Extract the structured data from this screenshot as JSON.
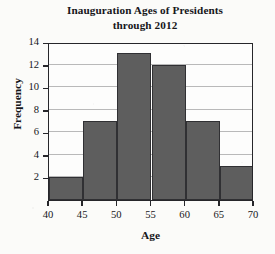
{
  "chart_data": {
    "type": "bar",
    "title": "Inauguration Ages of Presidents through 2012",
    "title_lines": [
      "Inauguration Ages of Presidents",
      "through 2012"
    ],
    "xlabel": "Age",
    "ylabel": "Frequency",
    "categories": [
      "40-45",
      "45-50",
      "50-55",
      "55-60",
      "60-65",
      "65-70"
    ],
    "bin_edges": [
      40,
      45,
      50,
      55,
      60,
      65,
      70
    ],
    "values": [
      2,
      7,
      13,
      12,
      7,
      3
    ],
    "xlim": [
      40,
      70
    ],
    "ylim": [
      0,
      14
    ],
    "xticks": [
      40,
      45,
      50,
      55,
      60,
      65,
      70
    ],
    "yticks": [
      2,
      4,
      6,
      8,
      10,
      12,
      14
    ],
    "xtick_labels": [
      "40",
      "45",
      "50",
      "55",
      "60",
      "65",
      "70"
    ],
    "ytick_labels": [
      "2",
      "4",
      "6",
      "8",
      "10",
      "12",
      "14"
    ],
    "grid": "horizontal",
    "legend": "none",
    "bar_color": "#5e5e5e",
    "bar_edge_color": "#303033",
    "gridline_color": "#b9b9b9",
    "axis_color": "#26262a",
    "background_color": "#fbfbf9"
  }
}
